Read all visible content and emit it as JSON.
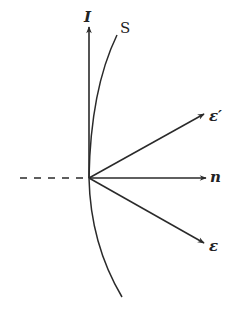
{
  "diagram": {
    "type": "reflection-vectors",
    "colors": {
      "stroke": "#2a2a2a",
      "background": "#ffffff"
    },
    "origin": {
      "x": 89,
      "y": 178
    },
    "labels": {
      "axis_I": "I",
      "surface": "S",
      "normal": "n",
      "vector_eps_prime": "ε′",
      "vector_eps": "ε"
    },
    "elements": [
      {
        "name": "axis-I",
        "kind": "arrow",
        "from": [
          89,
          178
        ],
        "to": [
          89,
          26
        ]
      },
      {
        "name": "surface-curve-S",
        "kind": "curve",
        "description": "arc through origin, concave left"
      },
      {
        "name": "normal-dashed",
        "kind": "dashed-line",
        "from": [
          20,
          178
        ],
        "to": [
          89,
          178
        ]
      },
      {
        "name": "normal-n",
        "kind": "arrow",
        "from": [
          89,
          178
        ],
        "to": [
          206,
          178
        ]
      },
      {
        "name": "vector-eps-prime",
        "kind": "arrow",
        "from": [
          89,
          178
        ],
        "to": [
          204,
          114
        ]
      },
      {
        "name": "vector-eps",
        "kind": "arrow",
        "from": [
          89,
          178
        ],
        "to": [
          204,
          243
        ]
      }
    ]
  }
}
